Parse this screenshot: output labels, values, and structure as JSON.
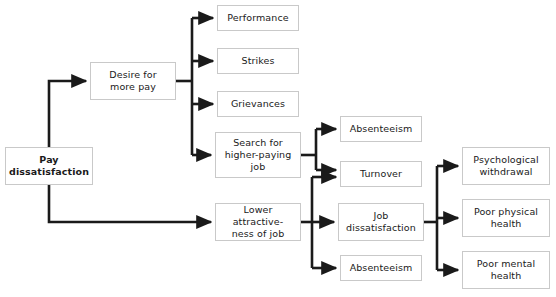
{
  "diagram": {
    "canvas": {
      "width": 556,
      "height": 297
    },
    "style": {
      "background": "#ffffff",
      "box_border": "#c9c9c9",
      "box_fill": "#ffffff",
      "arrow_color": "#1a1a1a",
      "text_color": "#1a1a1a"
    },
    "nodes": [
      {
        "id": "pay-dissatisfaction",
        "label": "Pay\ndissatisfaction",
        "x": 5,
        "y": 147,
        "w": 88,
        "h": 38,
        "bold": true
      },
      {
        "id": "desire-for-more-pay",
        "label": "Desire for\nmore pay",
        "x": 90,
        "y": 62,
        "w": 86,
        "h": 38,
        "bold": false
      },
      {
        "id": "performance",
        "label": "Performance",
        "x": 217,
        "y": 5,
        "w": 82,
        "h": 26,
        "bold": false
      },
      {
        "id": "strikes",
        "label": "Strikes",
        "x": 217,
        "y": 48,
        "w": 82,
        "h": 26,
        "bold": false
      },
      {
        "id": "grievances",
        "label": "Grievances",
        "x": 217,
        "y": 91,
        "w": 82,
        "h": 26,
        "bold": false
      },
      {
        "id": "search-higher-paying-job",
        "label": "Search for\nhigher-paying\njob",
        "x": 215,
        "y": 132,
        "w": 86,
        "h": 46,
        "bold": false
      },
      {
        "id": "lower-attractiveness-of-job",
        "label": "Lower attractive-\nness of job",
        "x": 215,
        "y": 203,
        "w": 86,
        "h": 38,
        "bold": false
      },
      {
        "id": "absenteeism-upper",
        "label": "Absenteeism",
        "x": 340,
        "y": 116,
        "w": 82,
        "h": 26,
        "bold": false
      },
      {
        "id": "turnover",
        "label": "Turnover",
        "x": 340,
        "y": 161,
        "w": 82,
        "h": 26,
        "bold": false
      },
      {
        "id": "job-dissatisfaction",
        "label": "Job\ndissatisfaction",
        "x": 338,
        "y": 203,
        "w": 86,
        "h": 38,
        "bold": false
      },
      {
        "id": "absenteeism-lower",
        "label": "Absenteeism",
        "x": 340,
        "y": 255,
        "w": 82,
        "h": 26,
        "bold": false
      },
      {
        "id": "psychological-withdrawal",
        "label": "Psychological\nwithdrawal",
        "x": 462,
        "y": 147,
        "w": 88,
        "h": 38,
        "bold": false
      },
      {
        "id": "poor-physical-health",
        "label": "Poor physical\nhealth",
        "x": 462,
        "y": 199,
        "w": 88,
        "h": 38,
        "bold": false
      },
      {
        "id": "poor-mental-health",
        "label": "Poor mental\nhealth",
        "x": 462,
        "y": 251,
        "w": 88,
        "h": 38,
        "bold": false
      }
    ],
    "edges": [
      {
        "from": "pay-dissatisfaction",
        "to": "desire-for-more-pay"
      },
      {
        "from": "pay-dissatisfaction",
        "to": "lower-attractiveness-of-job"
      },
      {
        "from": "desire-for-more-pay",
        "to": "performance"
      },
      {
        "from": "desire-for-more-pay",
        "to": "strikes"
      },
      {
        "from": "desire-for-more-pay",
        "to": "grievances"
      },
      {
        "from": "desire-for-more-pay",
        "to": "search-higher-paying-job"
      },
      {
        "from": "search-higher-paying-job",
        "to": "absenteeism-upper"
      },
      {
        "from": "search-higher-paying-job",
        "to": "turnover"
      },
      {
        "from": "lower-attractiveness-of-job",
        "to": "turnover"
      },
      {
        "from": "lower-attractiveness-of-job",
        "to": "job-dissatisfaction"
      },
      {
        "from": "lower-attractiveness-of-job",
        "to": "absenteeism-lower"
      },
      {
        "from": "job-dissatisfaction",
        "to": "psychological-withdrawal"
      },
      {
        "from": "job-dissatisfaction",
        "to": "poor-physical-health"
      },
      {
        "from": "job-dissatisfaction",
        "to": "poor-mental-health"
      }
    ]
  }
}
